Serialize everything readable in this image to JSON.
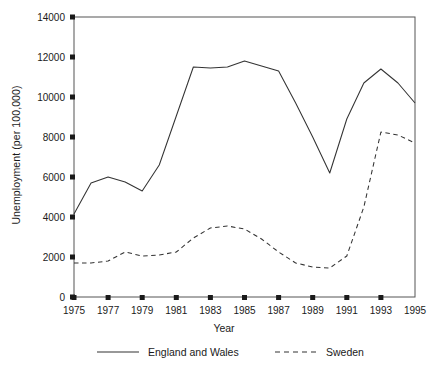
{
  "chart_data": {
    "type": "line",
    "title": "",
    "xlabel": "Year",
    "ylabel": "Unemployment (per 100,000)",
    "xlim": [
      1975,
      1995
    ],
    "ylim": [
      0,
      14000
    ],
    "ytick_values": [
      0,
      2000,
      4000,
      6000,
      8000,
      10000,
      12000,
      14000
    ],
    "ytick_labels": [
      "0",
      "2000",
      "4000",
      "6000",
      "8000",
      "10000",
      "12000",
      "14000"
    ],
    "xtick_values": [
      1975,
      1977,
      1979,
      1981,
      1983,
      1985,
      1987,
      1989,
      1991,
      1993,
      1995
    ],
    "xtick_labels": [
      "1975",
      "1977",
      "1979",
      "1981",
      "1983",
      "1985",
      "1987",
      "1989",
      "1991",
      "1993",
      "1995"
    ],
    "grid": false,
    "legend_position": "below",
    "x": [
      1975,
      1976,
      1977,
      1978,
      1979,
      1980,
      1981,
      1982,
      1983,
      1984,
      1985,
      1986,
      1987,
      1988,
      1989,
      1990,
      1991,
      1992,
      1993,
      1994,
      1995
    ],
    "series": [
      {
        "name": "England and Wales",
        "style": "solid",
        "color": "#333333",
        "values": [
          4150,
          5700,
          6000,
          5750,
          5300,
          6600,
          9050,
          11500,
          11450,
          11500,
          11800,
          11550,
          11300,
          9700,
          8000,
          6200,
          8900,
          10700,
          11400,
          10700,
          9700
        ]
      },
      {
        "name": "Sweden",
        "style": "dashed",
        "color": "#333333",
        "values": [
          1700,
          1700,
          1800,
          2250,
          2050,
          2100,
          2250,
          2950,
          3450,
          3550,
          3400,
          2900,
          2250,
          1700,
          1500,
          1450,
          2050,
          4500,
          8250,
          8100,
          7700
        ]
      }
    ]
  },
  "axes": {
    "xlabel": "Year",
    "ylabel": "Unemployment (per 100,000)"
  },
  "legend": {
    "entries": [
      {
        "label": "England and Wales",
        "style": "solid"
      },
      {
        "label": "Sweden",
        "style": "dashed"
      }
    ]
  }
}
